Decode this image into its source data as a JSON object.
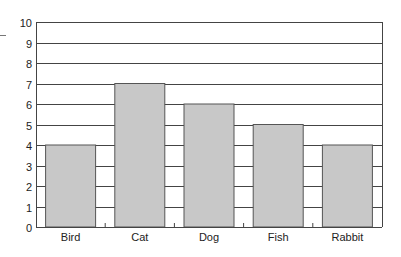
{
  "chart_data": {
    "type": "bar",
    "title": "",
    "xlabel": "",
    "ylabel": "",
    "categories": [
      "Bird",
      "Cat",
      "Dog",
      "Fish",
      "Rabbit"
    ],
    "values": [
      4,
      7,
      6,
      5,
      4
    ],
    "ylim": [
      0,
      10
    ],
    "yticks": [
      0,
      1,
      2,
      3,
      4,
      5,
      6,
      7,
      8,
      9,
      10
    ],
    "grid": true,
    "legend": null,
    "colors": {
      "bar": "#c8c8c8",
      "bar_border": "#555555",
      "grid": "#444444",
      "text": "#222222"
    }
  }
}
